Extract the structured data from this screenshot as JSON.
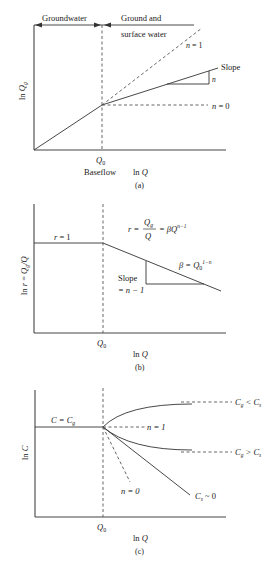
{
  "panel_a": {
    "caption": "(a)",
    "y_label_prefix": "ln ",
    "y_label_var": "Q",
    "y_label_sub": "g",
    "x_label_prefix": "ln ",
    "x_label_var": "Q",
    "q0_var": "Q",
    "q0_sub": "0",
    "baseflow": "Baseflow",
    "region_left": "Groundwater",
    "region_right_line1": "Ground and",
    "region_right_line2": "surface water",
    "n1_var": "n",
    "n1_eq": " = 1",
    "n0_var": "n",
    "n0_eq": " = 0",
    "slope_label": "Slope",
    "slope_value": "n"
  },
  "panel_b": {
    "caption": "(b)",
    "y_label": "ln r = Qg/Q",
    "y_label_prefix": "ln ",
    "y_label_r": "r",
    "y_label_eq": " = ",
    "y_label_q": "Q",
    "y_label_sub": "g",
    "y_label_div": "/Q",
    "x_label_prefix": "ln ",
    "x_label_var": "Q",
    "q0_var": "Q",
    "q0_sub": "0",
    "r1_var": "r",
    "r1_eq": " = 1",
    "formula_r": "r =",
    "formula_num": "Q",
    "formula_num_sub": "g",
    "formula_den": "Q",
    "formula_rhs": "= βQ",
    "formula_exp": "n−1",
    "beta_lhs": "β = Q",
    "beta_sub": "0",
    "beta_exp": "1−n",
    "slope_line1": "Slope",
    "slope_line2": "= n − 1"
  },
  "panel_c": {
    "caption": "(c)",
    "y_label_prefix": "ln ",
    "y_label_var": "C",
    "x_label_prefix": "ln ",
    "x_label_var": "Q",
    "q0_var": "Q",
    "q0_sub": "0",
    "c_eq_cg": "C = C",
    "c_eq_cg_sub": "g",
    "n1": "n = 1",
    "n0": "n = 0",
    "cg_lt_cs": "C",
    "cg_lt_cs_sub1": "g",
    "cg_lt_cs_op": " < C",
    "cg_lt_cs_sub2": "s",
    "cg_gt_cs": "C",
    "cg_gt_cs_sub1": "g",
    "cg_gt_cs_op": " > C",
    "cg_gt_cs_sub2": "s",
    "cs_zero": "C",
    "cs_zero_sub": "s",
    "cs_zero_rhs": " ~ 0"
  },
  "colors": {
    "line": "#333333",
    "text": "#222222",
    "background": "#ffffff"
  }
}
